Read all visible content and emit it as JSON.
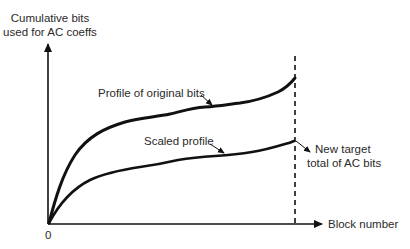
{
  "diagram": {
    "y_axis_label_line1": "Cumulative bits",
    "y_axis_label_line2": "used for AC coeffs",
    "x_axis_label": "Block number",
    "origin_label": "0",
    "curve_original_label": "Profile of original bits",
    "curve_scaled_label": "Scaled profile",
    "target_label_line1": "New target",
    "target_label_line2": "total of AC bits",
    "colors": {
      "line": "#111111",
      "text": "#2a2a2a",
      "background": "#ffffff"
    }
  }
}
